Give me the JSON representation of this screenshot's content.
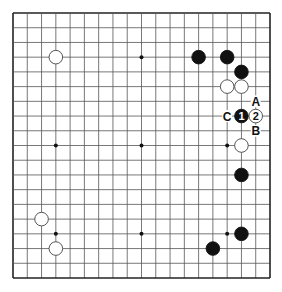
{
  "board": {
    "size": 19,
    "star_points": [
      [
        3,
        3
      ],
      [
        9,
        3
      ],
      [
        15,
        3
      ],
      [
        3,
        9
      ],
      [
        9,
        9
      ],
      [
        15,
        9
      ],
      [
        3,
        15
      ],
      [
        9,
        15
      ],
      [
        15,
        15
      ]
    ],
    "stones": [
      {
        "color": "white",
        "col": 3,
        "row": 3,
        "label": ""
      },
      {
        "color": "black",
        "col": 13,
        "row": 3,
        "label": ""
      },
      {
        "color": "black",
        "col": 15,
        "row": 3,
        "label": ""
      },
      {
        "color": "black",
        "col": 16,
        "row": 4,
        "label": ""
      },
      {
        "color": "white",
        "col": 15,
        "row": 5,
        "label": ""
      },
      {
        "color": "white",
        "col": 16,
        "row": 5,
        "label": ""
      },
      {
        "color": "black",
        "col": 16,
        "row": 7,
        "label": "1"
      },
      {
        "color": "white",
        "col": 17,
        "row": 7,
        "label": "2"
      },
      {
        "color": "white",
        "col": 16,
        "row": 9,
        "label": ""
      },
      {
        "color": "black",
        "col": 16,
        "row": 11,
        "label": ""
      },
      {
        "color": "black",
        "col": 16,
        "row": 15,
        "label": ""
      },
      {
        "color": "black",
        "col": 14,
        "row": 16,
        "label": ""
      },
      {
        "color": "white",
        "col": 2,
        "row": 14,
        "label": ""
      },
      {
        "color": "white",
        "col": 3,
        "row": 16,
        "label": ""
      }
    ],
    "markers": [
      {
        "text": "A",
        "col": 17,
        "row": 6
      },
      {
        "text": "B",
        "col": 17,
        "row": 8
      },
      {
        "text": "C",
        "col": 15,
        "row": 7
      }
    ],
    "colors": {
      "line": "#555555",
      "border": "#222222",
      "black_stone": "#111111",
      "white_stone": "#ffffff",
      "stone_outline": "#444444"
    }
  }
}
